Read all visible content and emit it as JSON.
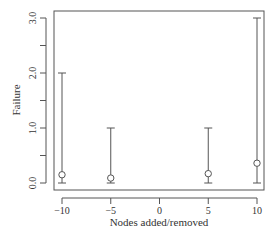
{
  "chart_data": {
    "type": "scatter",
    "title": "",
    "xlabel": "Nodes added/removed",
    "ylabel": "Failure",
    "xlim": [
      -11.2,
      10.8
    ],
    "ylim": [
      -0.13,
      3.13
    ],
    "x_ticks": [
      -10,
      -5,
      0,
      5,
      10
    ],
    "x_tick_labels": [
      "−10",
      "−5",
      "0",
      "5",
      "10"
    ],
    "y_ticks": [
      0.0,
      0.5,
      1.0,
      1.5,
      2.0,
      2.5,
      3.0
    ],
    "y_tick_labels": [
      "0.0",
      "",
      "1.0",
      "",
      "2.0",
      "",
      "3.0"
    ],
    "grid": false,
    "legend": null,
    "series": [
      {
        "name": "Failure",
        "marker": "open-circle",
        "x": [
          -10,
          -5,
          5,
          10
        ],
        "values": [
          0.15,
          0.09,
          0.17,
          0.36
        ],
        "error_low": [
          0,
          0,
          0,
          0
        ],
        "error_high": [
          2,
          1,
          1,
          3
        ]
      }
    ]
  },
  "colors": {
    "axis": "#555555",
    "bars": "#555555",
    "text": "#333333",
    "background": "#ffffff"
  }
}
